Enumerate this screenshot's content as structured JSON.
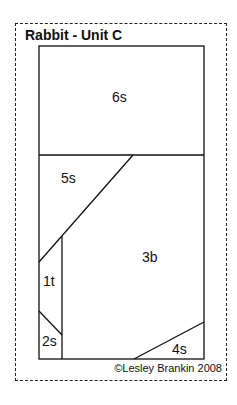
{
  "title": "Rabbit - Unit C",
  "pieces": [
    {
      "id": "6s",
      "label": "6s"
    },
    {
      "id": "5s",
      "label": "5s"
    },
    {
      "id": "3b",
      "label": "3b"
    },
    {
      "id": "1t",
      "label": "1t"
    },
    {
      "id": "2s",
      "label": "2s"
    },
    {
      "id": "4s",
      "label": "4s"
    }
  ],
  "copyright": "©Lesley Brankin 2008"
}
